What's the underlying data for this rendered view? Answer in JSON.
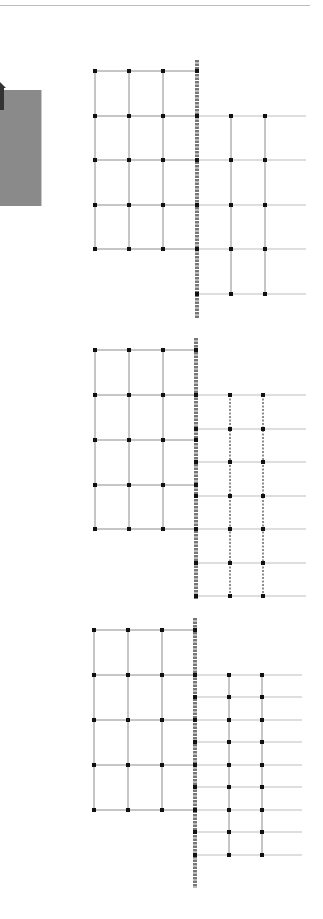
{
  "colors": {
    "line": "#8c8c8c",
    "light_line": "#bdbdbd",
    "node": "#111111",
    "fence": "#777777",
    "panel": "#8a8a8a"
  },
  "side_panel": {
    "icon": "arrow-icon"
  },
  "diagrams": [
    {
      "name": "grid-1",
      "left_cols": [
        95,
        129,
        163
      ],
      "fence_x": 197,
      "right_cols": [
        231,
        265
      ],
      "right_end": 306,
      "left_rows": [
        71,
        116,
        160,
        205,
        249
      ],
      "right_rows": [
        116,
        160,
        205,
        249,
        294
      ],
      "right_cols_dashed": false,
      "fence": [
        60,
        318
      ]
    },
    {
      "name": "grid-2",
      "left_cols": [
        95,
        129,
        163
      ],
      "fence_x": 196,
      "right_cols": [
        230,
        263
      ],
      "right_end": 306,
      "left_rows": [
        350,
        395,
        440,
        485,
        529
      ],
      "right_rows": [
        395,
        429,
        462,
        496,
        529,
        563,
        596
      ],
      "right_cols_dashed": true,
      "fence": [
        338,
        599
      ]
    },
    {
      "name": "grid-3",
      "left_cols": [
        94,
        128,
        162
      ],
      "fence_x": 195,
      "right_cols": [
        229,
        262
      ],
      "right_end": 302,
      "left_rows": [
        630,
        675,
        720,
        765,
        810
      ],
      "right_rows": [
        675,
        697,
        720,
        742,
        765,
        787,
        810,
        832,
        855
      ],
      "right_cols_dashed": false,
      "fence": [
        618,
        888
      ]
    }
  ]
}
